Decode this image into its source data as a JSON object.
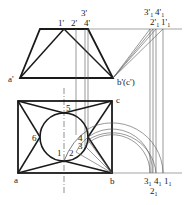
{
  "diagram": {
    "type": "orthographic-projection",
    "front_view": {
      "labels": {
        "a_prime": "a'",
        "b_prime_c_prime": "b'(c')",
        "p1": "1'",
        "p2": "2'",
        "p3": "3'",
        "p4": "4'",
        "p3_1": "3'",
        "p4_1": "4'",
        "p2_1": "2'",
        "p1_1": "1'",
        "sub1": "1"
      }
    },
    "top_view": {
      "labels": {
        "a": "a",
        "b": "b",
        "c": "c",
        "n1": "1",
        "n2": "2",
        "n3": "3",
        "n4": "4",
        "n5": "5",
        "n6": "6",
        "r3": "3",
        "r4": "4",
        "r1": "1",
        "r2": "2",
        "sub1": "1"
      }
    },
    "colors": {
      "thick": "#1a1a1a",
      "thin": "#555555"
    }
  }
}
